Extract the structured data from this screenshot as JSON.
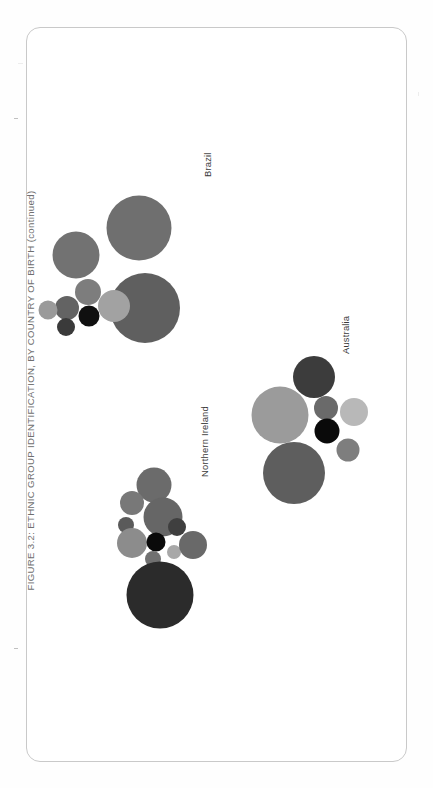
{
  "document": {
    "title": "FIGURE 3.2: ETHNIC GROUP IDENTIFICATION, BY COUNTRY OF BIRTH  (continued)",
    "caption_lines": [
      "The figure shows, for selected countries of birth of EVENS respondents, their reported ethnic group identification: within each country of birth,",
      "circles showing ethnic group identification are proportionately sized. The figure represents 8,384 respondents born in England, 718 born in",
      "Scotland, 517 in Wales, 412 in India, 263 in Nigeria, 188 in China, 186 in Poland, 156 in the USA, 87 in South Africa, 75 in France, 48 in Northern",
      "Ireland, 43 in Australia and 39 born in Brazil."
    ]
  },
  "colors": {
    "frame_border": "#c9c9c9",
    "title_text": "#6f6f6f",
    "caption_text": "#777777",
    "label_text": "#3a3a3a",
    "page_background": "#ffffff"
  },
  "chart_data": {
    "type": "bubble",
    "title": "FIGURE 3.2: ETHNIC GROUP IDENTIFICATION, BY COUNTRY OF BIRTH  (continued)",
    "xlabel": "",
    "ylabel": "",
    "legend_position": "none",
    "grid": false,
    "note": "Three proportional-circle clusters, one per country of birth. Circle area is proportional to the number of respondents giving that ethnic group identification. Greys encode distinct ethnic group categories.",
    "clusters": [
      {
        "name": "Brazil",
        "respondents": 39,
        "label_position": {
          "x": 176,
          "y": 150
        },
        "bubbles": [
          {
            "cx": 113,
            "cy": 201,
            "r": 32.5,
            "color": "#6f6f6f"
          },
          {
            "cx": 50,
            "cy": 228,
            "r": 23.5,
            "color": "#727272"
          },
          {
            "cx": 119,
            "cy": 281,
            "r": 35.0,
            "color": "#5f5f5f"
          },
          {
            "cx": 62,
            "cy": 265,
            "r": 13.0,
            "color": "#7d7d7d"
          },
          {
            "cx": 41,
            "cy": 281,
            "r": 12.0,
            "color": "#636363"
          },
          {
            "cx": 63,
            "cy": 289,
            "r": 10.5,
            "color": "#101010"
          },
          {
            "cx": 88,
            "cy": 279,
            "r": 16.0,
            "color": "#a2a2a2"
          },
          {
            "cx": 22,
            "cy": 283,
            "r": 9.5,
            "color": "#9a9a9a"
          },
          {
            "cx": 40,
            "cy": 300,
            "r": 9.0,
            "color": "#3a3a3a"
          }
        ]
      },
      {
        "name": "Australia",
        "respondents": 43,
        "label_position": {
          "x": 314,
          "y": 327
        },
        "bubbles": [
          {
            "cx": 288,
            "cy": 350,
            "r": 21.0,
            "color": "#3c3c3c"
          },
          {
            "cx": 254,
            "cy": 388,
            "r": 28.5,
            "color": "#9b9b9b"
          },
          {
            "cx": 300,
            "cy": 381,
            "r": 12.0,
            "color": "#6a6a6a"
          },
          {
            "cx": 328,
            "cy": 385,
            "r": 14.0,
            "color": "#b8b8b8"
          },
          {
            "cx": 301,
            "cy": 404,
            "r": 12.5,
            "color": "#0a0a0a"
          },
          {
            "cx": 322,
            "cy": 423,
            "r": 11.5,
            "color": "#7e7e7e"
          },
          {
            "cx": 268,
            "cy": 446,
            "r": 31.0,
            "color": "#5e5e5e"
          }
        ]
      },
      {
        "name": "Northern Ireland",
        "respondents": 48,
        "label_position": {
          "x": 173,
          "y": 450
        },
        "bubbles": [
          {
            "cx": 128,
            "cy": 458,
            "r": 17.5,
            "color": "#6b6b6b"
          },
          {
            "cx": 137,
            "cy": 490,
            "r": 19.5,
            "color": "#666666"
          },
          {
            "cx": 106,
            "cy": 476,
            "r": 12.0,
            "color": "#787878"
          },
          {
            "cx": 100,
            "cy": 498,
            "r": 8.0,
            "color": "#5a5a5a"
          },
          {
            "cx": 106,
            "cy": 516,
            "r": 15.0,
            "color": "#8c8c8c"
          },
          {
            "cx": 130,
            "cy": 515,
            "r": 9.5,
            "color": "#0a0a0a"
          },
          {
            "cx": 151,
            "cy": 500,
            "r": 9.0,
            "color": "#3f3f3f"
          },
          {
            "cx": 148,
            "cy": 525,
            "r": 7.0,
            "color": "#a8a8a8"
          },
          {
            "cx": 127,
            "cy": 532,
            "r": 8.0,
            "color": "#707070"
          },
          {
            "cx": 167,
            "cy": 518,
            "r": 14.0,
            "color": "#696969"
          },
          {
            "cx": 134,
            "cy": 568,
            "r": 33.5,
            "color": "#2b2b2b"
          }
        ]
      }
    ]
  }
}
